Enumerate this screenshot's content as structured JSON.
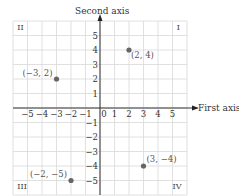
{
  "chart_data": {
    "type": "scatter",
    "title": "",
    "xlabel": "First axis",
    "ylabel": "Second axis",
    "xlim": [
      -6,
      6
    ],
    "ylim": [
      -6,
      6
    ],
    "grid": true,
    "x_ticks": [
      "−5",
      "−4",
      "−3",
      "−2",
      "−1",
      "0",
      "1",
      "2",
      "3",
      "4",
      "5"
    ],
    "y_ticks": [
      "5",
      "4",
      "3",
      "2",
      "1",
      "−1",
      "−2",
      "−3",
      "−4",
      "−5"
    ],
    "quadrants": [
      "I",
      "II",
      "III",
      "IV"
    ],
    "points": [
      {
        "x": 2,
        "y": 4,
        "label": "(2, 4)"
      },
      {
        "x": -3,
        "y": 2,
        "label": "(−3, 2)"
      },
      {
        "x": -2,
        "y": -5,
        "label": "(−2, −5)"
      },
      {
        "x": 3,
        "y": -4,
        "label": "(3, −4)"
      }
    ],
    "point_color": "#666666"
  }
}
